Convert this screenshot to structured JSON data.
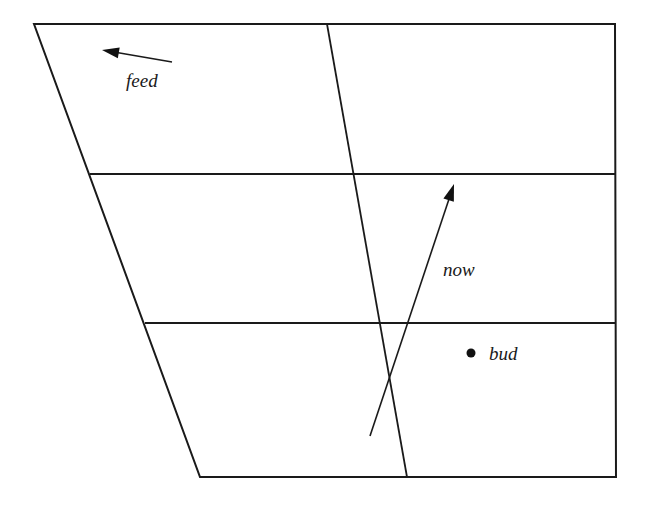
{
  "diagram": {
    "type": "vowel-quadrilateral",
    "colors": {
      "line": "#1a1a1a",
      "background": "#ffffff"
    },
    "frame": {
      "top_left": [
        34,
        24
      ],
      "top_right": [
        615,
        24
      ],
      "bottom_right": [
        616,
        477
      ],
      "bottom_left": [
        200,
        477
      ]
    },
    "dividers": {
      "vertical": {
        "from": [
          327,
          24
        ],
        "to": [
          407,
          477
        ]
      },
      "horizontal": [
        {
          "from": [
            90,
            174
          ],
          "to": [
            615,
            174
          ]
        },
        {
          "from": [
            145,
            323
          ],
          "to": [
            616,
            323
          ]
        }
      ]
    },
    "labels": [
      {
        "id": "feed",
        "text": "feed",
        "x": 126,
        "y": 87
      },
      {
        "id": "now",
        "text": "now",
        "x": 443,
        "y": 276
      },
      {
        "id": "bud",
        "text": "bud",
        "x": 489,
        "y": 360
      }
    ],
    "arrows": [
      {
        "id": "feed-arrow",
        "label": "feed",
        "from": [
          172,
          62
        ],
        "to": [
          102,
          50
        ]
      },
      {
        "id": "now-arrow",
        "label": "now",
        "from": [
          370,
          436
        ],
        "to": [
          454,
          184
        ]
      }
    ],
    "points": [
      {
        "id": "bud-point",
        "label": "bud",
        "cx": 471,
        "cy": 353,
        "r": 4.5
      }
    ]
  }
}
